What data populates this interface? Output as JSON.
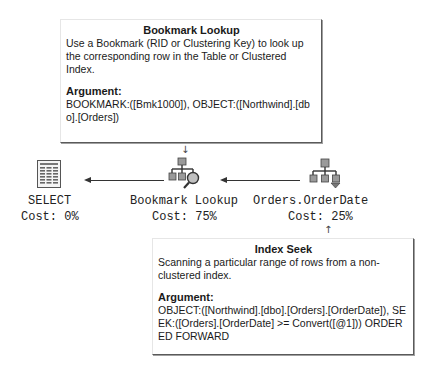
{
  "tooltips": {
    "bookmark_lookup": {
      "title": "Bookmark Lookup",
      "description": "Use a Bookmark (RID or Clustering Key) to look up the corresponding row in the Table or Clustered Index.",
      "argument_label": "Argument:",
      "argument_text": "BOOKMARK:([Bmk1000]), OBJECT:([Northwind].[dbo].[Orders])"
    },
    "index_seek": {
      "title": "Index Seek",
      "description": "Scanning a particular range of rows from a non-clustered index.",
      "argument_label": "Argument:",
      "argument_text": "OBJECT:([Northwind].[dbo].[Orders].[OrderDate]), SEEK:([Orders].[OrderDate] >= Convert([@1])) ORDERED FORWARD"
    }
  },
  "nodes": [
    {
      "name": "SELECT",
      "cost": "Cost: 0%",
      "icon": "select-result-icon"
    },
    {
      "name": "Bookmark Lookup",
      "cost": "Cost: 75%",
      "icon": "bookmark-lookup-icon"
    },
    {
      "name": "Orders.OrderDate",
      "cost": "Cost: 25%",
      "icon": "index-seek-icon"
    }
  ],
  "colors": {
    "node_box": "#9a9a9a",
    "node_accent": "#c0c0c0",
    "edge": "#333333"
  }
}
